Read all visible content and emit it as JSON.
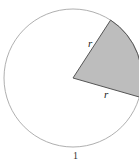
{
  "diagram": {
    "type": "circle-sector",
    "labels": {
      "radius_upper": "r",
      "radius_lower": "r",
      "caption": "1"
    },
    "colors": {
      "sector_fill": "#bdbdbd",
      "circle_stroke": "#9a9a9a",
      "sector_stroke": "#555555",
      "background": "#ffffff"
    },
    "geometry": {
      "center": [
        73,
        78
      ],
      "radius": 69,
      "sector_start_deg": -57,
      "sector_end_deg": 16
    }
  }
}
